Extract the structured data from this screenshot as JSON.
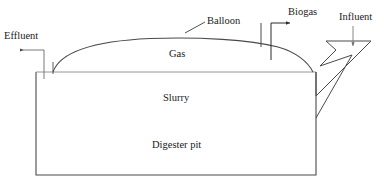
{
  "diagram": {
    "stroke_color": "#3c3c3c",
    "background_color": "#ffffff",
    "labels": {
      "effluent": "Effluent",
      "balloon": "Balloon",
      "biogas": "Biogas",
      "influent": "Influent",
      "gas": "Gas",
      "slurry": "Slurry",
      "digester_pit": "Digester pit"
    },
    "parts": {
      "effluent_pipe": "effluent-outlet-pipe",
      "balloon_dome": "gas-balloon-dome",
      "biogas_pipe": "biogas-outlet-pipe",
      "influent_funnel": "influent-inlet-funnel",
      "slurry_level_line": "slurry-surface-line",
      "pit_outline": "digester-pit-outline"
    }
  }
}
